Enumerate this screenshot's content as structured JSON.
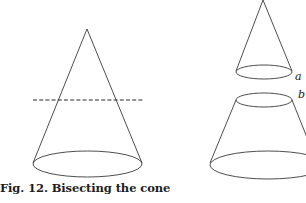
{
  "figure": {
    "caption": "Fig. 12.  Bisecting the cone",
    "labels": {
      "upper_piece": "a",
      "lower_piece": "b"
    },
    "parts": [
      {
        "name": "whole-cone",
        "description": "Complete cone with dashed cutting plane"
      },
      {
        "name": "cone-top-piece",
        "description": "Small cone cut off above the plane",
        "label": "a"
      },
      {
        "name": "frustum-piece",
        "description": "Truncated cone (frustum) below the plane",
        "label": "b"
      }
    ],
    "cutting_plane_style": "dashed"
  }
}
